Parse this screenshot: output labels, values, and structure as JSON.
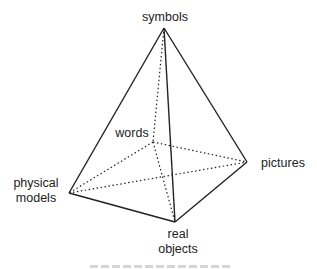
{
  "diagram": {
    "type": "pyramid",
    "vertices": {
      "apex": {
        "label": "symbols"
      },
      "back": {
        "label": "words"
      },
      "right": {
        "label": "pictures"
      },
      "left": {
        "label_line1": "physical",
        "label_line2": "models"
      },
      "front": {
        "label_line1": "real",
        "label_line2": "objects"
      }
    },
    "line_color": "#222222",
    "caption": ""
  }
}
